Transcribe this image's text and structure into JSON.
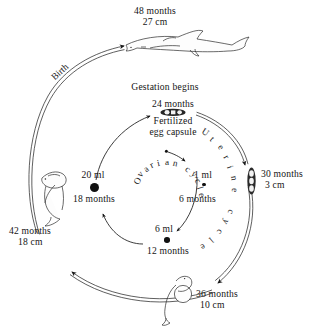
{
  "diagram": {
    "ink_color": "#141414",
    "stages": {
      "adult": {
        "months": "48 months",
        "size": "27 cm"
      },
      "gestation_header": "Gestation begins",
      "fertilized": {
        "months": "24 months",
        "label_line1": "Fertilized",
        "label_line2": "egg capsule"
      },
      "egg_case_30": {
        "months": "30 months",
        "size": "3 cm"
      },
      "embryo_36": {
        "months": "36 months",
        "size": "10 cm"
      },
      "pup_42": {
        "months": "42 months",
        "size": "18 cm"
      }
    },
    "ovarian_points": [
      {
        "volume": "1 ml",
        "months": "6 months",
        "dot_px": 3.6
      },
      {
        "volume": "6 ml",
        "months": "12 months",
        "dot_px": 5.6
      },
      {
        "volume": "20 ml",
        "months": "18 months",
        "dot_px": 9.0
      }
    ],
    "cycle_labels": {
      "ovarian": "Ovarian cycle",
      "ovarian_line1": "Ovarian",
      "ovarian_line2": "cycle",
      "uterine": "Uterine cycle"
    },
    "arrow_labels": {
      "birth": "Birth"
    },
    "icons": {
      "adult": "adult-shark-icon",
      "egg_capsule": "egg-capsule-icon",
      "egg_case": "egg-case-embryos-icon",
      "embryo_yolk": "embryo-with-yolk-sac-icon",
      "pup": "shark-pup-icon",
      "origin": "ovum-origin-dot"
    }
  }
}
